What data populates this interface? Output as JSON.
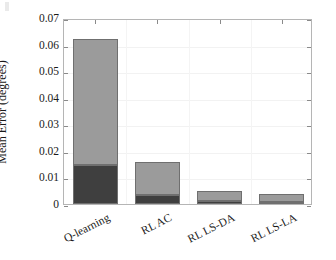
{
  "chart_data": {
    "type": "bar",
    "subtype": "stacked",
    "title": "",
    "xlabel": "",
    "ylabel": "Mean Error (degrees)",
    "categories": [
      "Q-learning",
      "RL AC",
      "RL LS-DA",
      "RL LS-LA"
    ],
    "series": [
      {
        "name": "lower-segment",
        "color": "#3f3f3f",
        "values": [
          0.0145,
          0.0033,
          0.0011,
          0.0009
        ]
      },
      {
        "name": "upper-segment",
        "color": "#9b9b9b",
        "values": [
          0.0475,
          0.0127,
          0.0037,
          0.0028
        ]
      }
    ],
    "totals": [
      0.062,
      0.016,
      0.0048,
      0.0037
    ],
    "ylim": [
      0,
      0.07
    ],
    "yticks": [
      0,
      0.01,
      0.02,
      0.03,
      0.04,
      0.05,
      0.06,
      0.07
    ],
    "ytick_labels": [
      "0",
      "0.01",
      "0.02",
      "0.03",
      "0.04",
      "0.05",
      "0.06",
      "0.07"
    ],
    "grid": true,
    "legend": null,
    "legend_position": "none",
    "box": true,
    "tick_direction": "in",
    "xtick_label_rotation": -27
  },
  "axes": {
    "y_title": "Mean Error (degrees)",
    "y_tick_labels": [
      "0.07",
      "0.06",
      "0.05",
      "0.04",
      "0.03",
      "0.02",
      "0.01",
      "0"
    ],
    "x_tick_labels": [
      "Q-learning",
      "RL AC",
      "RL LS-DA",
      "RL LS-LA"
    ]
  },
  "colors": {
    "lower_segment": "#3f3f3f",
    "upper_segment": "#9b9b9b",
    "bar_edge": "#6f6f6f",
    "axis": "#b5b5b5",
    "grid": "#f2f2f2",
    "text": "#1a1a1a",
    "background": "#ffffff"
  }
}
